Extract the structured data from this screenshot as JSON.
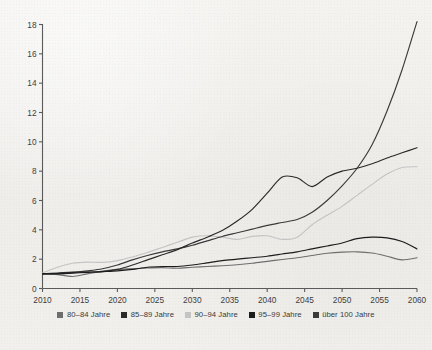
{
  "chart_data": {
    "type": "line",
    "title": "",
    "subtitle": "",
    "xlabel": "",
    "ylabel": "",
    "xlim": [
      2010,
      2060
    ],
    "ylim": [
      0,
      18
    ],
    "x_ticks": [
      2010,
      2015,
      2020,
      2025,
      2030,
      2035,
      2040,
      2045,
      2050,
      2055,
      2060
    ],
    "y_ticks": [
      0,
      2,
      4,
      6,
      8,
      10,
      12,
      14,
      16,
      18
    ],
    "grid": false,
    "legend_position": "bottom",
    "x": [
      2010,
      2012,
      2014,
      2016,
      2018,
      2020,
      2022,
      2024,
      2026,
      2028,
      2030,
      2032,
      2034,
      2036,
      2038,
      2040,
      2042,
      2044,
      2046,
      2048,
      2050,
      2052,
      2054,
      2056,
      2058,
      2060
    ],
    "series": [
      {
        "name": "80–84 Jahre",
        "color": "#6e6e6e",
        "values": [
          1.0,
          0.95,
          0.82,
          1.0,
          1.18,
          1.3,
          1.35,
          1.4,
          1.42,
          1.38,
          1.45,
          1.5,
          1.55,
          1.62,
          1.72,
          1.85,
          1.98,
          2.1,
          2.25,
          2.4,
          2.48,
          2.5,
          2.42,
          2.2,
          1.95,
          2.1
        ]
      },
      {
        "name": "85–89 Jahre",
        "color": "#2a2a2a",
        "values": [
          1.0,
          1.05,
          1.12,
          1.12,
          1.15,
          1.3,
          1.6,
          1.95,
          2.3,
          2.65,
          3.1,
          3.5,
          3.95,
          4.6,
          5.4,
          6.5,
          7.6,
          7.55,
          6.95,
          7.6,
          8.0,
          8.2,
          8.5,
          8.9,
          9.25,
          9.6
        ]
      },
      {
        "name": "90–94 Jahre",
        "color": "#c4c4c4",
        "values": [
          1.05,
          1.45,
          1.72,
          1.8,
          1.78,
          1.9,
          2.15,
          2.45,
          2.8,
          3.15,
          3.5,
          3.6,
          3.5,
          3.35,
          3.55,
          3.6,
          3.35,
          3.5,
          4.35,
          5.0,
          5.6,
          6.35,
          7.1,
          7.8,
          8.25,
          8.3
        ]
      },
      {
        "name": "95–99 Jahre",
        "color": "#1c1c1c",
        "values": [
          1.0,
          1.0,
          1.05,
          1.1,
          1.15,
          1.2,
          1.3,
          1.45,
          1.5,
          1.5,
          1.6,
          1.75,
          1.9,
          2.0,
          2.1,
          2.2,
          2.35,
          2.5,
          2.7,
          2.9,
          3.1,
          3.4,
          3.5,
          3.45,
          3.2,
          2.7
        ]
      },
      {
        "name": "über 100 Jahre",
        "color": "#3a3a3a",
        "values": [
          1.0,
          1.02,
          1.08,
          1.2,
          1.35,
          1.6,
          1.95,
          2.25,
          2.5,
          2.7,
          2.95,
          3.25,
          3.55,
          3.8,
          4.05,
          4.3,
          4.5,
          4.7,
          5.2,
          6.0,
          7.0,
          8.2,
          9.8,
          12.1,
          14.9,
          18.2
        ]
      }
    ]
  },
  "legend": {
    "items": [
      {
        "label": "80–84 Jahre",
        "color": "#6e6e6e"
      },
      {
        "label": "85–89 Jahre",
        "color": "#2a2a2a"
      },
      {
        "label": "90–94 Jahre",
        "color": "#c4c4c4"
      },
      {
        "label": "95–99 Jahre",
        "color": "#1c1c1c"
      },
      {
        "label": "über 100 Jahre",
        "color": "#3a3a3a"
      }
    ]
  },
  "axes": {
    "axis_color": "#5a5a5a",
    "tick_color": "#3d3d3d"
  }
}
